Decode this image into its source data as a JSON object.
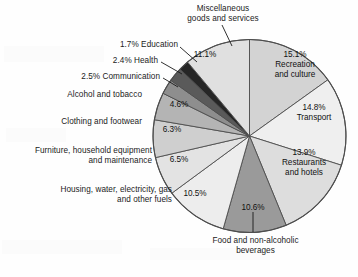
{
  "chart_data": {
    "type": "pie",
    "title": "",
    "units": "percent",
    "legend": "none",
    "labels_inside": true,
    "categories": [
      "Recreation and culture",
      "Transport",
      "Restaurants and hotels",
      "Food and non-alcoholic beverages",
      "Housing, water, electricity, gas and other fuels",
      "Furniture, household equipment and maintenance",
      "Clothing and footwear",
      "Alcohol and tobacco",
      "Communication",
      "Health",
      "Education",
      "Miscellaneous goods and services"
    ],
    "values": [
      15.1,
      14.8,
      13.9,
      10.6,
      10.5,
      6.5,
      6.3,
      4.6,
      2.5,
      2.4,
      1.7,
      11.1
    ],
    "value_labels": [
      "15.1%",
      "14.8%",
      "13.9%",
      "10.6%",
      "10.5%",
      "6.5%",
      "6.3%",
      "4.6%",
      "2.5%",
      "2.4%",
      "1.7%",
      "11.1%"
    ],
    "colors": [
      "#d3d3d3",
      "#efefef",
      "#dddddd",
      "#9a9a9a",
      "#ededed",
      "#e3e3e3",
      "#cfcfcf",
      "#b4b4b4",
      "#8e8e8e",
      "#5a5a5a",
      "#262626",
      "#e0e0e0"
    ],
    "start_angle_deg": -90,
    "direction": "clockwise",
    "stroke": "#4d4d4d"
  },
  "slice_labels": {
    "recreation": {
      "pct": "15.1%",
      "name_line1": "Recreation",
      "name_line2": "and culture"
    },
    "transport": {
      "pct": "14.8%",
      "name_line1": "Transport"
    },
    "restaurants": {
      "pct": "13.9%",
      "name_line1": "Restaurants",
      "name_line2": "and hotels"
    },
    "food": {
      "pct": "10.6%"
    },
    "housing": {
      "pct": "10.5%"
    },
    "furniture": {
      "pct": "6.5%"
    },
    "clothing": {
      "pct": "6.3%"
    },
    "alcohol": {
      "pct": "4.6%"
    },
    "misc": {
      "pct": "11.1%"
    }
  },
  "outer_labels": {
    "misc_line1": "Miscellaneous",
    "misc_line2": "goods and services",
    "education": "1.7% Education",
    "health": "2.4% Health",
    "communication": "2.5% Communication",
    "alcohol": "Alcohol and tobacco",
    "clothing": "Clothing and footwear",
    "furniture_line1": "Furniture, household equipment",
    "furniture_line2": "and maintenance",
    "housing_line1": "Housing, water, electricity, gas",
    "housing_line2": "and other fuels",
    "food_line1": "Food and non-alcoholic",
    "food_line2": "beverages"
  }
}
